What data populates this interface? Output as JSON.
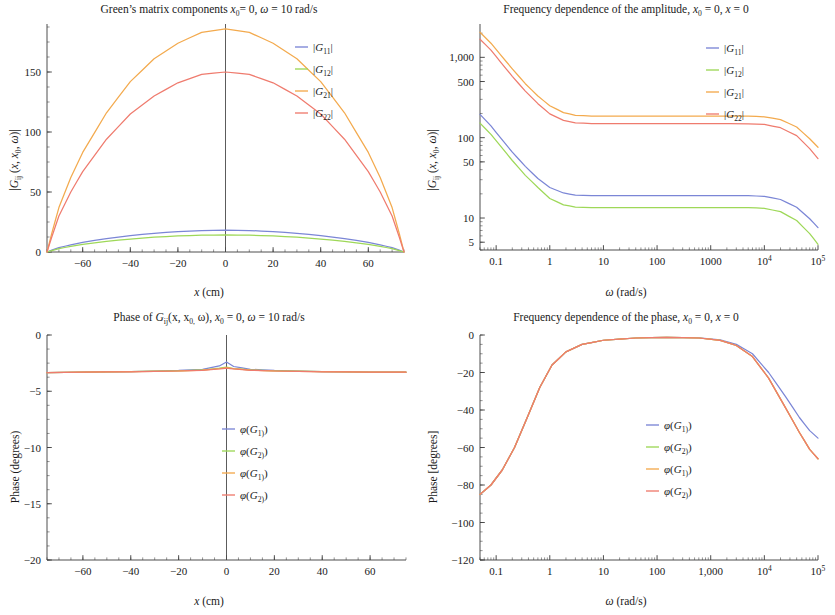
{
  "figure": {
    "panels": [
      "amplitude-vs-x",
      "amplitude-vs-omega",
      "phase-vs-x",
      "phase-vs-omega"
    ]
  },
  "panel_tl": {
    "title_parts": {
      "a": "Green’s matrix components ",
      "x0": "x",
      "x0sub": "0",
      "b": "= 0, ",
      "omega": "ω",
      "c": " = 10 rad/s"
    },
    "title_plain": "Green’s matrix components x0 = 0, ω = 10 rad/s",
    "xlabel_parts": {
      "sym": "x",
      "unit": " (cm)"
    },
    "xlabel_plain": "x (cm)",
    "ylabel_plain": "|Gij (x, x0, ω)|",
    "xticks": [
      "-60",
      "-40",
      "-20",
      "0",
      "20",
      "40",
      "60"
    ],
    "yticks": [
      "0",
      "50",
      "100",
      "150"
    ],
    "legend": [
      "|G11|",
      "|G12|",
      "|G21|",
      "|G22|"
    ]
  },
  "panel_tr": {
    "title_parts": {
      "a": "Frequency dependence of the amplitude, ",
      "x0": "x",
      "x0sub": "0",
      "b": " = 0, ",
      "x": "x",
      "c": " = 0"
    },
    "title_plain": "Frequency dependence of the amplitude, x0 = 0, x = 0",
    "xlabel_parts": {
      "sym": "ω",
      "unit": " (rad/s)"
    },
    "xlabel_plain": "ω (rad/s)",
    "ylabel_plain": "|Gij (x, x0, ω)|",
    "xticks": [
      "0.1",
      "1",
      "10",
      "100",
      "1000",
      "10⁴",
      "10⁵"
    ],
    "yticks": [
      "5",
      "10",
      "50",
      "100",
      "500",
      "1,000"
    ],
    "legend": [
      "|G11|",
      "|G12|",
      "|G21|",
      "|G22|"
    ]
  },
  "panel_bl": {
    "title_parts": {
      "a": "Phase of ",
      "G": "G",
      "Gsub": "ij",
      "b": "(x, x",
      "bsub": "0,",
      "c": " ω), ",
      "x0": "x",
      "x0sub": "0",
      "d": " = 0, ",
      "omega": "ω",
      "e": " = 10 rad/s"
    },
    "title_plain": "Phase of Gij(x, x0, ω), x0 = 0, ω = 10 rad/s",
    "xlabel_parts": {
      "sym": "x",
      "unit": " (cm)"
    },
    "xlabel_plain": "x (cm)",
    "ylabel": "Phase (degrees)",
    "xticks": [
      "-60",
      "-40",
      "-20",
      "0",
      "20",
      "40",
      "60"
    ],
    "yticks": [
      "0",
      "-5",
      "-10",
      "-15",
      "-20"
    ],
    "legend": [
      "φ(G11)",
      "φ(G12)",
      "φ(G21)",
      "φ(G22)"
    ]
  },
  "panel_br": {
    "title_parts": {
      "a": "Frequency dependence of the phase, ",
      "x0": "x",
      "x0sub": "0",
      "b": " = 0, ",
      "x": "x",
      "c": " = 0"
    },
    "title_plain": "Frequency dependence of the phase, x0 = 0, x = 0",
    "xlabel_parts": {
      "sym": "ω",
      "unit": " (rad/s)"
    },
    "xlabel_plain": "ω (rad/s)",
    "ylabel": "Phase [degrees]",
    "xticks": [
      "0.1",
      "1",
      "10",
      "100",
      "1,000",
      "10⁴",
      "10⁵"
    ],
    "yticks": [
      "0",
      "-20",
      "-40",
      "-60",
      "-80",
      "-100",
      "-120"
    ],
    "legend": [
      "φ(G11)",
      "φ(G12)",
      "φ(G21)",
      "φ(G22)"
    ]
  },
  "colors": {
    "G11": "#7b86d6",
    "G12": "#9ed858",
    "G21": "#f3aa4e",
    "G22": "#ef7b6e",
    "axis": "#3a3a3a",
    "text": "#1a1a1a"
  },
  "chart_data": [
    {
      "id": "amplitude-vs-x",
      "type": "line",
      "title": "Green’s matrix components x0 = 0, ω = 10 rad/s",
      "xlabel": "x (cm)",
      "ylabel": "|Gij (x, x0, ω)|",
      "xscale": "linear",
      "yscale": "linear",
      "xlim": [
        -75,
        75
      ],
      "ylim": [
        0,
        190
      ],
      "xticks": [
        -60,
        -40,
        -20,
        0,
        20,
        40,
        60
      ],
      "yticks": [
        0,
        50,
        100,
        150
      ],
      "grid": false,
      "legend_position": "top-right",
      "x": [
        -75,
        -73,
        -70,
        -65,
        -60,
        -50,
        -40,
        -30,
        -20,
        -10,
        0,
        10,
        20,
        30,
        40,
        50,
        60,
        65,
        70,
        73,
        75
      ],
      "series": [
        {
          "name": "|G11|",
          "color": "#7b86d6",
          "values": [
            0,
            1.5,
            3.6,
            6.0,
            8.0,
            11.2,
            13.7,
            15.6,
            17.0,
            17.9,
            18.2,
            17.9,
            17.0,
            15.6,
            13.7,
            11.2,
            8.0,
            6.0,
            3.6,
            1.5,
            0
          ]
        },
        {
          "name": "|G12|",
          "color": "#9ed858",
          "values": [
            0,
            1.2,
            2.8,
            4.7,
            6.3,
            8.8,
            10.8,
            12.3,
            13.4,
            14.0,
            14.3,
            14.0,
            13.4,
            12.3,
            10.8,
            8.8,
            6.3,
            4.7,
            2.8,
            1.2,
            0
          ]
        },
        {
          "name": "|G21|",
          "color": "#f3aa4e",
          "values": [
            0,
            15.5,
            37.0,
            62.0,
            83.0,
            116.0,
            142.0,
            161.0,
            174.0,
            183.0,
            186.0,
            183.0,
            174.0,
            161.0,
            142.0,
            116.0,
            83.0,
            62.0,
            37.0,
            15.5,
            0
          ]
        },
        {
          "name": "|G22|",
          "color": "#ef7b6e",
          "values": [
            0,
            12.5,
            30.0,
            50.0,
            67.0,
            94.0,
            115.0,
            130.0,
            141.0,
            148.0,
            150.0,
            148.0,
            141.0,
            130.0,
            115.0,
            94.0,
            67.0,
            50.0,
            30.0,
            12.5,
            0
          ]
        }
      ]
    },
    {
      "id": "amplitude-vs-omega",
      "type": "line",
      "title": "Frequency dependence of the amplitude, x0 = 0, x = 0",
      "xlabel": "ω (rad/s)",
      "ylabel": "|Gij (x, x0, ω)|",
      "xscale": "log",
      "yscale": "log",
      "xlim": [
        0.05,
        100000
      ],
      "ylim": [
        4,
        2600
      ],
      "xticks": [
        0.1,
        1,
        10,
        100,
        1000,
        10000,
        100000
      ],
      "xticklabels": [
        "0.1",
        "1",
        "10",
        "100",
        "1000",
        "10⁴",
        "10⁵"
      ],
      "yticks": [
        5,
        10,
        50,
        100,
        500,
        1000
      ],
      "yticklabels": [
        "5",
        "10",
        "50",
        "100",
        "500",
        "1,000"
      ],
      "grid": false,
      "legend_position": "top-right",
      "x": [
        0.05,
        0.08,
        0.12,
        0.2,
        0.35,
        0.6,
        1,
        1.8,
        3,
        6,
        10,
        100,
        1000,
        5000,
        10000,
        20000,
        40000,
        70000,
        100000
      ],
      "series": [
        {
          "name": "|G11|",
          "color": "#7b86d6",
          "values": [
            195,
            140,
            100,
            66,
            44,
            31,
            24,
            20.5,
            19.3,
            19.0,
            19.0,
            19.0,
            19.0,
            19.0,
            18.6,
            17.0,
            13.6,
            9.8,
            7.6
          ]
        },
        {
          "name": "|G12|",
          "color": "#9ed858",
          "values": [
            152,
            110,
            79,
            52,
            34,
            24,
            17.5,
            14.6,
            13.7,
            13.5,
            13.5,
            13.5,
            13.5,
            13.5,
            13.2,
            12.0,
            9.3,
            6.4,
            4.7
          ]
        },
        {
          "name": "|G21|",
          "color": "#f3aa4e",
          "values": [
            2050,
            1500,
            1080,
            720,
            470,
            330,
            250,
            205,
            190,
            186,
            186,
            186,
            186,
            186,
            182,
            168,
            136,
            97,
            76
          ]
        },
        {
          "name": "|G22|",
          "color": "#ef7b6e",
          "values": [
            1680,
            1230,
            880,
            580,
            380,
            265,
            198,
            164,
            153,
            150,
            150,
            150,
            150,
            149,
            146,
            133,
            106,
            73,
            55
          ]
        }
      ]
    },
    {
      "id": "phase-vs-x",
      "type": "line",
      "title": "Phase of Gij(x, x0, ω), x0 = 0, ω = 10 rad/s",
      "xlabel": "x (cm)",
      "ylabel": "Phase (degrees)",
      "xscale": "linear",
      "yscale": "linear",
      "xlim": [
        -75,
        75
      ],
      "ylim": [
        -20,
        0
      ],
      "xticks": [
        -60,
        -40,
        -20,
        0,
        20,
        40,
        60
      ],
      "yticks": [
        0,
        -5,
        -10,
        -15,
        -20
      ],
      "grid": false,
      "legend_position": "center-right",
      "x": [
        -75,
        -60,
        -40,
        -20,
        -10,
        -3,
        0,
        3,
        10,
        20,
        40,
        60,
        75
      ],
      "series": [
        {
          "name": "φ(G11)",
          "color": "#7b86d6",
          "values": [
            -3.35,
            -3.3,
            -3.25,
            -3.15,
            -3.05,
            -2.75,
            -2.4,
            -2.8,
            -3.05,
            -3.15,
            -3.25,
            -3.3,
            -3.3
          ]
        },
        {
          "name": "φ(G12)",
          "color": "#9ed858",
          "values": [
            -3.35,
            -3.3,
            -3.25,
            -3.18,
            -3.1,
            -2.95,
            -2.85,
            -2.98,
            -3.1,
            -3.18,
            -3.25,
            -3.3,
            -3.3
          ]
        },
        {
          "name": "φ(G21)",
          "color": "#f3aa4e",
          "values": [
            -3.35,
            -3.3,
            -3.26,
            -3.2,
            -3.12,
            -3.0,
            -2.9,
            -3.0,
            -3.12,
            -3.2,
            -3.26,
            -3.3,
            -3.3
          ]
        },
        {
          "name": "φ(G22)",
          "color": "#ef7b6e",
          "values": [
            -3.35,
            -3.3,
            -3.27,
            -3.2,
            -3.14,
            -3.02,
            -2.95,
            -3.02,
            -3.14,
            -3.2,
            -3.27,
            -3.3,
            -3.3
          ]
        }
      ]
    },
    {
      "id": "phase-vs-omega",
      "type": "line",
      "title": "Frequency dependence of the phase, x0 = 0, x = 0",
      "xlabel": "ω (rad/s)",
      "ylabel": "Phase [degrees]",
      "xscale": "log",
      "yscale": "linear",
      "xlim": [
        0.05,
        100000
      ],
      "ylim": [
        -120,
        0
      ],
      "xticks": [
        0.1,
        1,
        10,
        100,
        1000,
        10000,
        100000
      ],
      "xticklabels": [
        "0.1",
        "1",
        "10",
        "100",
        "1,000",
        "10⁴",
        "10⁵"
      ],
      "yticks": [
        0,
        -20,
        -40,
        -60,
        -80,
        -100,
        -120
      ],
      "grid": false,
      "legend_position": "center-right",
      "x": [
        0.05,
        0.08,
        0.13,
        0.22,
        0.38,
        0.65,
        1.1,
        2,
        4,
        10,
        40,
        150,
        600,
        1500,
        3000,
        6000,
        12000,
        25000,
        45000,
        70000,
        100000
      ],
      "series": [
        {
          "name": "φ(G11)",
          "color": "#7b86d6",
          "values": [
            -85,
            -80,
            -72,
            -60,
            -44,
            -28,
            -16,
            -9,
            -5,
            -2.8,
            -1.6,
            -1.3,
            -1.5,
            -2.6,
            -5,
            -10,
            -20,
            -33,
            -44,
            -51,
            -55
          ]
        },
        {
          "name": "φ(G12)",
          "color": "#9ed858",
          "values": [
            -85,
            -80,
            -72,
            -60,
            -44,
            -28,
            -16,
            -9,
            -5,
            -2.8,
            -1.6,
            -1.3,
            -1.6,
            -2.9,
            -5.6,
            -11.5,
            -23,
            -39,
            -52,
            -61,
            -66
          ]
        },
        {
          "name": "φ(G21)",
          "color": "#f3aa4e",
          "values": [
            -85,
            -80,
            -72,
            -60,
            -44,
            -28,
            -16,
            -9,
            -5,
            -2.8,
            -1.6,
            -1.3,
            -1.6,
            -2.9,
            -5.6,
            -11.5,
            -23,
            -39,
            -52,
            -61,
            -66
          ]
        },
        {
          "name": "φ(G22)",
          "color": "#ef7b6e",
          "values": [
            -85,
            -80,
            -72,
            -60,
            -44,
            -28,
            -16,
            -9,
            -5,
            -2.8,
            -1.6,
            -1.3,
            -1.6,
            -2.9,
            -5.6,
            -11.5,
            -23,
            -39,
            -52,
            -61,
            -66
          ]
        }
      ]
    }
  ]
}
